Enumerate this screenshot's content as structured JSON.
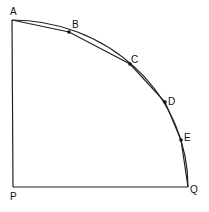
{
  "diagram": {
    "type": "quarter-circle with inscribed polygonal chords",
    "colors": {
      "stroke": "#222222",
      "background": "#ffffff",
      "point": "#111111"
    },
    "points": {
      "A": {
        "label": "A",
        "x": 12,
        "y": 20
      },
      "B": {
        "label": "B",
        "x": 69,
        "y": 32
      },
      "C": {
        "label": "C",
        "x": 130,
        "y": 64
      },
      "D": {
        "label": "D",
        "x": 165,
        "y": 102
      },
      "E": {
        "label": "E",
        "x": 181,
        "y": 140
      },
      "P": {
        "label": "P",
        "x": 13,
        "y": 187
      },
      "Q": {
        "label": "Q",
        "x": 188,
        "y": 187
      }
    },
    "segments": [
      {
        "from": "P",
        "to": "A",
        "kind": "radius"
      },
      {
        "from": "P",
        "to": "Q",
        "kind": "radius"
      },
      {
        "from": "A",
        "to": "B",
        "kind": "chord"
      },
      {
        "from": "B",
        "to": "C",
        "kind": "chord"
      },
      {
        "from": "C",
        "to": "D",
        "kind": "chord"
      },
      {
        "from": "D",
        "to": "E",
        "kind": "chord"
      },
      {
        "from": "E",
        "to": "Q",
        "kind": "chord"
      }
    ],
    "arc": {
      "from": "A",
      "to": "Q",
      "center": "P"
    },
    "labels": {
      "A": "A",
      "B": "B",
      "C": "C",
      "D": "D",
      "E": "E",
      "P": "P",
      "Q": "Q"
    }
  }
}
